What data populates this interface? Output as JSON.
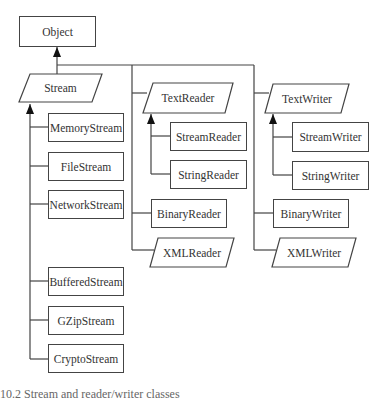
{
  "diagram": {
    "root": {
      "label": "Object"
    },
    "stream": {
      "label": "Stream",
      "children": [
        "MemoryStream",
        "FileStream",
        "NetworkStream",
        "BufferedStream",
        "GZipStream",
        "CryptoStream"
      ]
    },
    "text_reader": {
      "label": "TextReader",
      "children": [
        "StreamReader",
        "StringReader"
      ]
    },
    "reader_siblings": [
      "BinaryReader",
      "XMLReader"
    ],
    "text_writer": {
      "label": "TextWriter",
      "children": [
        "StreamWriter",
        "StringWriter"
      ]
    },
    "writer_siblings": [
      "BinaryWriter",
      "XMLWriter"
    ],
    "shape_legend": {
      "rectangle": "concrete class",
      "parallelogram": "abstract class"
    },
    "caption": "10.2  Stream and reader/writer classes"
  }
}
